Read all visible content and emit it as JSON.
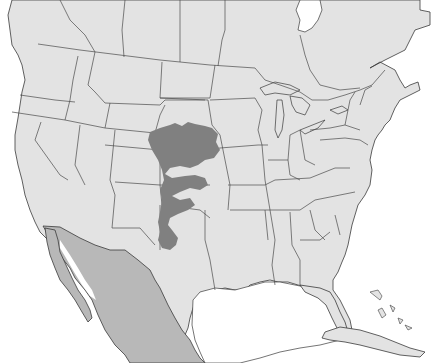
{
  "map": {
    "type": "range-map",
    "region": "North America",
    "colors": {
      "ocean": "#ffffff",
      "land": "#e3e3e3",
      "mexico": "#b8b8b8",
      "range": "#808080",
      "lines": "#3a3a3a"
    },
    "regions_shown": [
      "Canada",
      "United States",
      "Mexico",
      "Cuba",
      "Bahamas"
    ],
    "highlighted_range": {
      "label": "species range",
      "states": [
        "Nebraska",
        "South Dakota",
        "Colorado",
        "Kansas",
        "Oklahoma",
        "New Mexico",
        "Texas",
        "Wyoming"
      ]
    },
    "highlighted_country": "Mexico"
  }
}
